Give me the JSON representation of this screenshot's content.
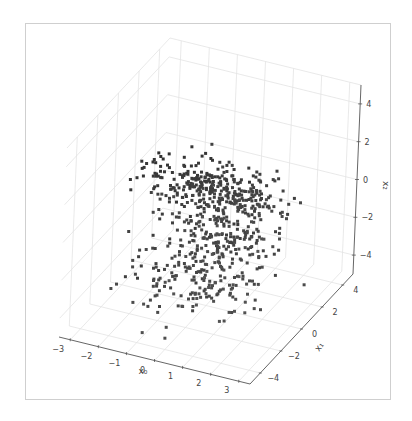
{
  "chart_data": {
    "type": "scatter",
    "subtype": "scatter3d",
    "title": "",
    "axes": {
      "x": {
        "label": "x0",
        "label_display": "x₀",
        "ticks": [
          -3,
          -2,
          -1,
          0,
          1,
          2,
          3
        ],
        "range": [
          -3.4,
          3.4
        ]
      },
      "y": {
        "label": "x1",
        "label_display": "x₁",
        "ticks": [
          -4,
          -2,
          0,
          2,
          4
        ],
        "range": [
          -5,
          5
        ]
      },
      "z": {
        "label": "x2",
        "label_display": "x₂",
        "ticks": [
          -4,
          -2,
          0,
          2,
          4
        ],
        "range": [
          -5,
          5
        ]
      }
    },
    "grid": true,
    "legend": null,
    "marker": {
      "shape": "square",
      "color": "#3a3a3a",
      "size": 3
    },
    "approx_point_count": 700,
    "clusters": [
      {
        "name": "horizontal-band",
        "center": [
          -0.5,
          1.5,
          0.2
        ],
        "spread": [
          1.2,
          0.8,
          0.4
        ],
        "n": 260
      },
      {
        "name": "central-cloud",
        "center": [
          0.3,
          0.0,
          -1.2
        ],
        "spread": [
          1.0,
          1.6,
          1.4
        ],
        "n": 320
      },
      {
        "name": "lower-scatter",
        "center": [
          0.0,
          -1.0,
          -3.2
        ],
        "spread": [
          1.2,
          1.5,
          0.9
        ],
        "n": 120
      }
    ]
  },
  "frame": {
    "border_color": "#cfcfcf",
    "pane_grid_color": "#e3e3e3",
    "axis_color": "#555555",
    "tick_text_color": "#444444"
  }
}
